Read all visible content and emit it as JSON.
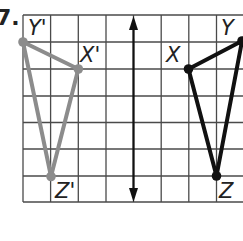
{
  "problem": {
    "number_label": "7."
  },
  "grid": {
    "x_lines": [
      23,
      50.6,
      78.3,
      106,
      133.5,
      161.2,
      188.8,
      216.5,
      244
    ],
    "y_lines": [
      15,
      42,
      69,
      96,
      122.5,
      149,
      176,
      202
    ],
    "color": "#4a4a4a"
  },
  "line_of_reflection": {
    "x": 133.5,
    "y_top": 16,
    "y_bottom": 202,
    "color": "#111111",
    "arrows": "both"
  },
  "image_triangle": {
    "color": "#8c8c8c",
    "vertices": [
      {
        "name": "Y'",
        "x": 23,
        "y": 42,
        "label_x": 28,
        "label_y": 35
      },
      {
        "name": "X'",
        "x": 78.3,
        "y": 69,
        "label_x": 80,
        "label_y": 62
      },
      {
        "name": "Z'",
        "x": 51,
        "y": 176.5,
        "label_x": 55,
        "label_y": 198
      }
    ]
  },
  "preimage_triangle": {
    "color": "#111111",
    "vertices": [
      {
        "name": "X",
        "x": 188.5,
        "y": 69,
        "label_x": 166,
        "label_y": 62
      },
      {
        "name": "Y",
        "x": 242,
        "y": 41,
        "label_x": 221,
        "label_y": 35
      },
      {
        "name": "Z",
        "x": 216.5,
        "y": 176,
        "label_x": 219,
        "label_y": 198
      }
    ]
  }
}
